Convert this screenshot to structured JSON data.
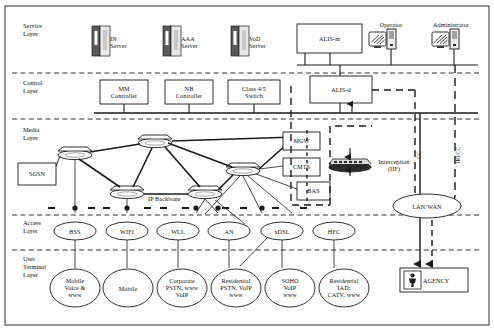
{
  "diagram": {
    "layers": [
      {
        "id": "service",
        "label": "Service\nLayer",
        "label_line1": "Service",
        "label_line2": "Layer"
      },
      {
        "id": "control",
        "label_line1": "Control",
        "label_line2": "Layer"
      },
      {
        "id": "media",
        "label_line1": "Media",
        "label_line2": "Layer"
      },
      {
        "id": "access",
        "label_line1": "Access",
        "label_line2": "Layer"
      },
      {
        "id": "user",
        "label_line1": "User",
        "label_line2": "Terminal",
        "label_line3": "Layer"
      }
    ],
    "service_layer": {
      "servers": [
        {
          "name": "in-server",
          "line1": "IN",
          "line2": "Server"
        },
        {
          "name": "aaa-server",
          "line1": "AAA",
          "line2": "Server"
        },
        {
          "name": "vod-server",
          "line1": "VoD",
          "line2": "Server"
        }
      ],
      "alis_m": "ALIS-m",
      "workstations": [
        {
          "name": "operator",
          "label": "Operator"
        },
        {
          "name": "administrator",
          "label": "Administrator"
        }
      ]
    },
    "control_layer": {
      "boxes": [
        {
          "name": "mm-controller",
          "line1": "MM",
          "line2": "Controller"
        },
        {
          "name": "nb-controller",
          "line1": "NB",
          "line2": "Controller"
        },
        {
          "name": "class45-switch",
          "line1": "Class 4/5",
          "line2": "Switch"
        }
      ],
      "alis_d": "ALIS-d"
    },
    "media_layer": {
      "sgsn": "SGSN",
      "ip_backbone": "IP Backbone",
      "side_boxes": [
        {
          "name": "mgw",
          "label": "MGW"
        },
        {
          "name": "cmts",
          "label": "CMTS"
        },
        {
          "name": "bas",
          "label": "BAS"
        }
      ],
      "interception": {
        "line1": "Interception",
        "line2": "(IIF)"
      },
      "link_labels": [
        {
          "name": "cc-link",
          "label": "CC"
        },
        {
          "name": "iri-cc-link",
          "label": "IRI/CC"
        }
      ],
      "lan_wan": "LAN/WAN"
    },
    "access_layer": {
      "nodes": [
        {
          "name": "bss",
          "label": "BSS"
        },
        {
          "name": "wifi",
          "label": "WIFI"
        },
        {
          "name": "wll",
          "label": "WLL"
        },
        {
          "name": "an",
          "label": "AN"
        },
        {
          "name": "adsl",
          "label": "xDSL"
        },
        {
          "name": "hfc",
          "label": "HFC"
        }
      ]
    },
    "user_terminal_layer": {
      "nodes": [
        {
          "name": "mobile-voice-www",
          "lines": [
            "Mobile",
            "Voice &",
            "www"
          ]
        },
        {
          "name": "mobile",
          "lines": [
            "Mobile"
          ]
        },
        {
          "name": "corporate",
          "lines": [
            "Corporate",
            "PSTN, www",
            "VoIP"
          ]
        },
        {
          "name": "residential-pstn",
          "lines": [
            "Residential",
            "PSTN, VoIP",
            "www"
          ]
        },
        {
          "name": "soho",
          "lines": [
            "SOHO",
            "VoIP",
            "www"
          ]
        },
        {
          "name": "residential-iad",
          "lines": [
            "Residential",
            "IAD:",
            "CATV, www"
          ]
        }
      ]
    },
    "agency": {
      "label": "AGENCY"
    },
    "colors": {
      "line": "#1a1a1a",
      "fill": "#ffffff",
      "text": "#111111",
      "icon_dark": "#3a3a3a"
    }
  }
}
